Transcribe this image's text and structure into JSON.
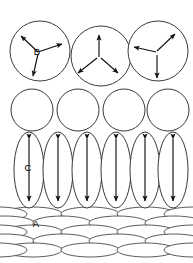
{
  "figure": {
    "width": 193,
    "height": 263,
    "background_color": "#ffffff",
    "outline_color": "#3a3a3a",
    "arrow_color": "#111111",
    "label_color": "#000000"
  },
  "labels": {
    "a": "A",
    "b": "B",
    "c": "C"
  },
  "layers": [
    {
      "id": "layer-b",
      "label": "B",
      "shape": "circle",
      "description": "top row of three large circles each containing three arrows radiating from a common centre",
      "count": 3,
      "radius": 30,
      "centers": [
        {
          "cx": 40,
          "cy": 51
        },
        {
          "cx": 101,
          "cy": 56
        },
        {
          "cx": 158,
          "cy": 51
        }
      ],
      "arrow_sets": [
        {
          "origin": {
            "x": 38,
            "y": 52
          },
          "directions_deg": [
            152,
            20,
            -70
          ]
        },
        {
          "origin": {
            "x": 99,
            "y": 57
          },
          "directions_deg": [
            90,
            -145,
            -35
          ]
        },
        {
          "origin": {
            "x": 156,
            "y": 52
          },
          "directions_deg": [
            168,
            48,
            -80
          ]
        }
      ]
    },
    {
      "id": "layer-mid",
      "label": "",
      "shape": "circle",
      "description": "second row of four medium circles, no arrows",
      "count": 4,
      "radius": 21,
      "centers": [
        {
          "cx": 32,
          "cy": 110
        },
        {
          "cx": 78,
          "cy": 110
        },
        {
          "cx": 124,
          "cy": 110
        },
        {
          "cx": 168,
          "cy": 110
        }
      ]
    },
    {
      "id": "layer-c",
      "label": "C",
      "shape": "ellipse-vertical",
      "description": "third row of six tall vertical ellipses, each containing a vertical double-headed arrow",
      "count": 6,
      "rx": 15,
      "ry": 38,
      "centers": [
        {
          "cx": 29,
          "cy": 170
        },
        {
          "cx": 58,
          "cy": 170
        },
        {
          "cx": 87,
          "cy": 170
        },
        {
          "cx": 116,
          "cy": 170
        },
        {
          "cx": 145,
          "cy": 170
        },
        {
          "cx": 173,
          "cy": 170
        }
      ],
      "arrow_type": "double-headed-vertical",
      "arrow_length": 62
    },
    {
      "id": "layer-a",
      "label": "A",
      "shape": "ellipse-flat",
      "description": "bottom block of stacked flat horizontal ellipses arranged in five rows across four columns",
      "rows": 5,
      "columns": 4,
      "rx": 29,
      "ry": 7,
      "row_y": [
        214,
        223,
        232,
        241,
        250
      ],
      "column_x": [
        33,
        90,
        146,
        189
      ],
      "row_offset_x": 28
    }
  ],
  "label_positions": {
    "a": {
      "x": 36,
      "y": 224
    },
    "b": {
      "x": 37,
      "y": 52
    },
    "c": {
      "x": 28,
      "y": 168
    }
  }
}
